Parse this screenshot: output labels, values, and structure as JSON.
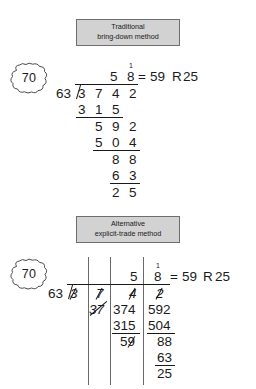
{
  "document": {
    "title": "Long division: traditional bring-down vs alternative explicit-trade",
    "problem": {
      "dividend": "3742",
      "divisor": "63",
      "quotient": "59",
      "remainder": "25"
    },
    "colors": {
      "caption_fill": "#d2d2d2",
      "caption_border": "#6e6e6e",
      "ink": "#1a1a1a",
      "column_rule": "#6a6a6a"
    }
  },
  "panels": [
    {
      "id": "traditional",
      "caption": {
        "line1": "Traditional",
        "line2": "bring-down method"
      },
      "badge": {
        "label": "70",
        "shape": "scalloped-cloud"
      },
      "result": {
        "equals": "=",
        "quotient": "59",
        "remainder_label": "R",
        "remainder": "25"
      },
      "carry_mark": "1",
      "quotient_digits": [
        "5",
        "8"
      ],
      "divisor": "63",
      "dividend_digits": [
        "3",
        "7",
        "4",
        "2"
      ],
      "work_rows": [
        {
          "digits": [
            "3",
            "1",
            "5"
          ],
          "underline": true
        },
        {
          "digits": [
            "5",
            "9",
            "2"
          ],
          "underline": false
        },
        {
          "digits": [
            "5",
            "0",
            "4"
          ],
          "underline": true
        },
        {
          "digits": [
            "8",
            "8"
          ],
          "underline": false
        },
        {
          "digits": [
            "6",
            "3"
          ],
          "underline": true
        },
        {
          "digits": [
            "2",
            "5"
          ],
          "underline": false
        }
      ]
    },
    {
      "id": "alternative",
      "caption": {
        "line1": "Alternative",
        "line2": "explicit-trade method"
      },
      "badge": {
        "label": "70",
        "shape": "scalloped-cloud"
      },
      "result": {
        "equals": "=",
        "quotient": "59",
        "remainder_label": "R",
        "remainder": "25"
      },
      "carry_mark": "1",
      "divisor": "63",
      "quotient_digits": [
        "5",
        "8"
      ],
      "columns": [
        {
          "name": "thousands",
          "traded_digit": "3",
          "rows": []
        },
        {
          "name": "hundreds",
          "traded_digit": "7",
          "rows": [
            {
              "value": "37",
              "struck": true,
              "underline": false
            }
          ]
        },
        {
          "name": "tens",
          "traded_digit": "4",
          "rows": [
            {
              "value": "374",
              "struck": false,
              "underline": false
            },
            {
              "value": "315",
              "struck": false,
              "underline": true
            },
            {
              "value": "59",
              "struck": true,
              "underline": false
            }
          ]
        },
        {
          "name": "ones",
          "traded_digit": "2",
          "rows": [
            {
              "value": "592",
              "struck": false,
              "underline": false
            },
            {
              "value": "504",
              "struck": false,
              "underline": true
            },
            {
              "value": "88",
              "struck": false,
              "underline": false
            },
            {
              "value": "63",
              "struck": false,
              "underline": true
            },
            {
              "value": "25",
              "struck": false,
              "underline": false
            }
          ]
        }
      ]
    }
  ]
}
